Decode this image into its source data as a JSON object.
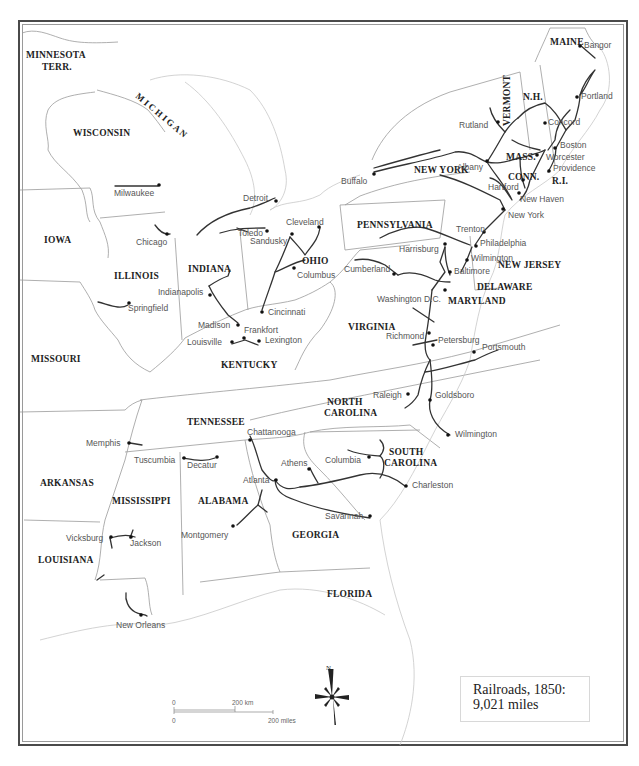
{
  "title": {
    "line1": "Railroads, 1850:",
    "line2": "9,021 miles"
  },
  "lake": "M I C H I G A N",
  "states": [
    {
      "id": "minnesota",
      "label": "MINNESOTA",
      "label2": "TERR."
    },
    {
      "id": "wisconsin",
      "label": "WISCONSIN"
    },
    {
      "id": "iowa",
      "label": "IOWA"
    },
    {
      "id": "illinois",
      "label": "ILLINOIS"
    },
    {
      "id": "indiana",
      "label": "INDIANA"
    },
    {
      "id": "ohio",
      "label": "OHIO"
    },
    {
      "id": "missouri",
      "label": "MISSOURI"
    },
    {
      "id": "kentucky",
      "label": "KENTUCKY"
    },
    {
      "id": "tennessee",
      "label": "TENNESSEE"
    },
    {
      "id": "arkansas",
      "label": "ARKANSAS"
    },
    {
      "id": "mississippi",
      "label": "MISSISSIPPI"
    },
    {
      "id": "alabama",
      "label": "ALABAMA"
    },
    {
      "id": "georgia",
      "label": "GEORGIA"
    },
    {
      "id": "louisiana",
      "label": "LOUISIANA"
    },
    {
      "id": "florida",
      "label": "FLORIDA"
    },
    {
      "id": "south-carolina",
      "label": "SOUTH",
      "label2": "CAROLINA"
    },
    {
      "id": "north-carolina",
      "label": "NORTH",
      "label2": "CAROLINA"
    },
    {
      "id": "virginia",
      "label": "VIRGINIA"
    },
    {
      "id": "maryland",
      "label": "MARYLAND"
    },
    {
      "id": "delaware",
      "label": "DELAWARE"
    },
    {
      "id": "new-jersey",
      "label": "NEW JERSEY"
    },
    {
      "id": "pennsylvania",
      "label": "PENNSYLVANIA"
    },
    {
      "id": "new-york",
      "label": "NEW YORK"
    },
    {
      "id": "vermont",
      "label": "VERMONT"
    },
    {
      "id": "new-hampshire",
      "label": "N.H."
    },
    {
      "id": "maine",
      "label": "MAINE"
    },
    {
      "id": "massachusetts",
      "label": "MASS."
    },
    {
      "id": "connecticut",
      "label": "CONN."
    },
    {
      "id": "rhode-island",
      "label": "R.I."
    }
  ],
  "cities": [
    "Bangor",
    "Portland",
    "Concord",
    "Rutland",
    "Boston",
    "Worcester",
    "Providence",
    "Albany",
    "Hartford",
    "New Haven",
    "New York",
    "Buffalo",
    "Trenton",
    "Philadelphia",
    "Wilmington",
    "Harrisburg",
    "Baltimore",
    "Cumberland",
    "Washington D.C.",
    "Richmond",
    "Petersburg",
    "Portsmouth",
    "Raleigh",
    "Goldsboro",
    "Wilmington",
    "Milwaukee",
    "Detroit",
    "Toledo",
    "Sandusky",
    "Cleveland",
    "Chicago",
    "Columbus",
    "Indianapolis",
    "Springfield",
    "Cincinnati",
    "Madison",
    "Frankfort",
    "Louisville",
    "Lexington",
    "Memphis",
    "Chattanooga",
    "Tuscumbia",
    "Decatur",
    "Athens",
    "Columbia",
    "Atlanta",
    "Charleston",
    "Savannah",
    "Vicksburg",
    "Jackson",
    "Montgomery",
    "New Orleans"
  ],
  "scale": {
    "km_zero": "0",
    "km_label": "200 km",
    "mi_zero": "0",
    "mi_label": "200 miles"
  },
  "compass": {
    "north_label": "N"
  }
}
